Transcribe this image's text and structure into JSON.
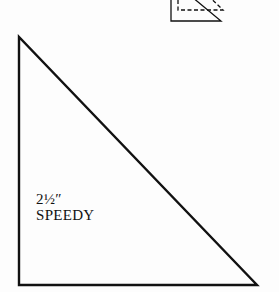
{
  "diagram": {
    "type": "quilt-template",
    "shape": "right-triangle",
    "size_label": "2½″",
    "name_label": "SPEEDY",
    "stroke_color": "#111111",
    "background_color": "#fdfdfd"
  },
  "thumbnail_icon": {
    "name": "folded-triangle-icon",
    "description": "small triangle with dashed overlapping triangle"
  }
}
